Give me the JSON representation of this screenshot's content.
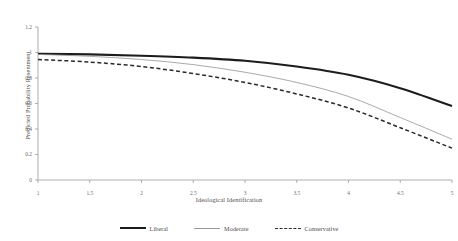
{
  "chart_data": {
    "type": "line",
    "title": "",
    "xlabel": "Ideological Identification",
    "ylabel": "Predicted Probability Resentment",
    "xlim": [
      1,
      5
    ],
    "ylim": [
      0,
      1.2
    ],
    "xticks": [
      "1",
      "1.5",
      "2",
      "2.5",
      "3",
      "3.5",
      "4",
      "4.5",
      "5"
    ],
    "yticks": [
      "0",
      "0.2",
      "0.4",
      "0.6",
      "0.8",
      "1",
      "1.2"
    ],
    "grid": false,
    "legend_position": "bottom",
    "x": [
      1,
      1.5,
      2,
      2.5,
      3,
      3.5,
      4,
      4.5,
      5
    ],
    "series": [
      {
        "name": "Liberal",
        "style": "solid-thick",
        "color": "#1c1c1c",
        "values": [
          0.99,
          0.985,
          0.975,
          0.96,
          0.935,
          0.89,
          0.825,
          0.72,
          0.58
        ]
      },
      {
        "name": "Moderate",
        "style": "solid-thin",
        "color": "#9a9a9a",
        "values": [
          0.985,
          0.97,
          0.945,
          0.905,
          0.845,
          0.765,
          0.655,
          0.49,
          0.32
        ]
      },
      {
        "name": "Conservative",
        "style": "dashed",
        "color": "#2a2a2a",
        "values": [
          0.945,
          0.925,
          0.89,
          0.835,
          0.765,
          0.675,
          0.565,
          0.41,
          0.25
        ]
      }
    ]
  },
  "colors": {
    "axis": "#9a9a9a",
    "liberal": "#1c1c1c",
    "moderate": "#9a9a9a",
    "conservative": "#2a2a2a",
    "text": "#4a4a4a"
  }
}
